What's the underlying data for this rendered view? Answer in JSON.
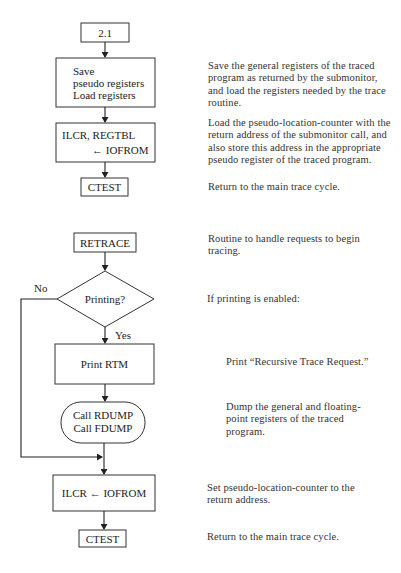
{
  "flowchart_top": {
    "entry": {
      "label": "2.1"
    },
    "save_box": {
      "lines": [
        "Save",
        "pseudo registers",
        "Load registers"
      ]
    },
    "ilcr_box": {
      "lines": [
        "ILCR, REGTBL",
        "←  IOFROM"
      ]
    },
    "exit": {
      "label": "CTEST"
    }
  },
  "flowchart_bottom": {
    "entry": {
      "label": "RETRACE"
    },
    "decision": {
      "label": "Printing?",
      "no_label": "No",
      "yes_label": "Yes"
    },
    "print_box": {
      "label": "Print RTM"
    },
    "call_box": {
      "lines": [
        "Call RDUMP",
        "Call FDUMP"
      ]
    },
    "ilcr_box": {
      "label": "ILCR ← IOFROM"
    },
    "exit": {
      "label": "CTEST"
    }
  },
  "descriptions": {
    "save": "Save the general registers of the traced program as returned by the submonitor, and load the registers needed by the trace routine.",
    "ilcr": "Load the pseudo-location-counter with the return address of the submonitor call, and also store this address in the appropriate pseudo register of the traced program.",
    "ctest_top": "Return to the main trace cycle.",
    "retrace": "Routine to handle requests to begin tracing.",
    "printing": "If printing is enabled:",
    "print_rtm": "Print “Recursive Trace Request.”",
    "dump": "Dump the general and floating-point registers of the traced program.",
    "set_plc": "Set pseudo-location-counter to the return address.",
    "ctest_bottom": "Return to the main trace cycle."
  }
}
